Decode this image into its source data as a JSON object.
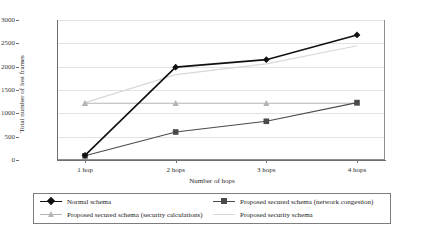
{
  "chart_data": {
    "type": "line",
    "title": "",
    "xlabel": "Number of hops",
    "ylabel": "Total number of lost frames",
    "categories": [
      "1 hop",
      "2 hops",
      "3 hops",
      "4 hops"
    ],
    "ylim": [
      0,
      3000
    ],
    "yticks": [
      0,
      500,
      1000,
      1500,
      2000,
      2500,
      3000
    ],
    "ytick_labels": [
      "0",
      "500",
      "1000",
      "1500",
      "2000",
      "2500",
      "3000"
    ],
    "grid": "horizontal",
    "legend_position": "below",
    "series": [
      {
        "name": "Normal schema",
        "values": [
          100,
          1990,
          2150,
          2680
        ],
        "color": "#111111",
        "marker": "diamond"
      },
      {
        "name": "Proposed secured schema (network congestion)",
        "values": [
          90,
          600,
          830,
          1230
        ],
        "color": "#4a4a4a",
        "marker": "square"
      },
      {
        "name": "Proposed secured schema (security calculations)",
        "values": [
          1215,
          1215,
          1215,
          1215
        ],
        "color": "#b4b4b4",
        "marker": "triangle"
      },
      {
        "name": "Proposed security schema",
        "values": [
          1230,
          1830,
          2060,
          2450
        ],
        "color": "#d8d8d8",
        "marker": "none"
      }
    ]
  },
  "legend": {
    "items": [
      {
        "label": "Normal schema",
        "marker": "diamond",
        "color": "#111111"
      },
      {
        "label": "Proposed secured schema (network congestion)",
        "marker": "square",
        "color": "#4a4a4a"
      },
      {
        "label": "Proposed secured schema (security calculations)",
        "marker": "triangle",
        "color": "#b4b4b4"
      },
      {
        "label": "Proposed security schema",
        "marker": "none",
        "color": "#d8d8d8"
      }
    ]
  },
  "colors": {
    "axis": "#6f6f6f",
    "grid": "#e2e2e2",
    "plot_border": "#8e8e8e",
    "background": "#ffffff"
  }
}
